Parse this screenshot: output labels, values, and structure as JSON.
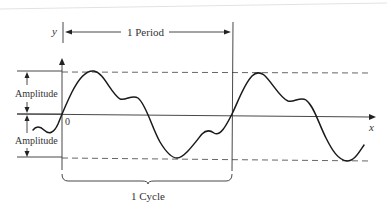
{
  "diagram": {
    "labels": {
      "y_axis": "y",
      "x_axis": "x",
      "origin": "0",
      "period": "1 Period",
      "amplitude_upper": "Amplitude",
      "amplitude_lower": "Amplitude",
      "cycle": "1 Cycle"
    },
    "colors": {
      "stroke": "#222222",
      "text": "#333333",
      "guide": "#555555",
      "background": "#ffffff"
    },
    "geometry": {
      "origin": [
        62,
        114
      ],
      "period_start_x": 62,
      "period_end_x": 232,
      "max_y": 71,
      "min_y": 158
    }
  }
}
